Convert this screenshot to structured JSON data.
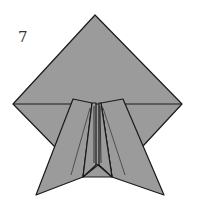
{
  "diagram": {
    "step_number": "7",
    "colors": {
      "paper_fill": "#9b9b9b",
      "line": "#1a1a1a",
      "background": "#ffffff"
    }
  }
}
